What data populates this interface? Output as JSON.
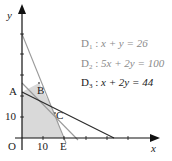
{
  "diagram": {
    "axes": {
      "x_label": "x",
      "y_label": "y",
      "origin_label": "O",
      "x_tick_label": "10",
      "y_tick_label": "10"
    },
    "points": {
      "A": "A",
      "B": "B",
      "C": "C",
      "E": "E"
    },
    "lines": [
      {
        "name": "D",
        "sub": "1",
        "equation": "x + y = 26",
        "color": "#9a9a9a"
      },
      {
        "name": "D",
        "sub": "2",
        "equation": "5x + 2y = 100",
        "color": "#9a9a9a"
      },
      {
        "name": "D",
        "sub": "3",
        "equation": "x + 2y = 44",
        "color": "#2a2a2a"
      }
    ],
    "feasible_region_color": "#d9d9d9"
  }
}
